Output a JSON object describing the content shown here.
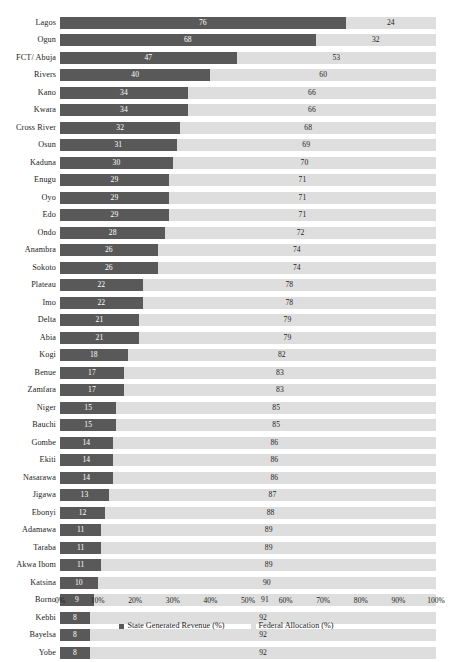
{
  "chart_data": {
    "type": "bar",
    "subtype": "stacked-horizontal-100-percent",
    "title": "",
    "subtitle": "",
    "xlabel": "",
    "ylabel": "",
    "xlim": [
      0,
      100
    ],
    "grid": false,
    "legend_position": "bottom",
    "axis_tick_labels": [
      "0%",
      "10%",
      "20%",
      "30%",
      "40%",
      "50%",
      "60%",
      "70%",
      "80%",
      "90%",
      "100%"
    ],
    "axis_tick_values": [
      0,
      10,
      20,
      30,
      40,
      50,
      60,
      70,
      80,
      90,
      100
    ],
    "categories": [
      "Lagos",
      "Ogun",
      "FCT/ Abuja",
      "Rivers",
      "Kano",
      "Kwara",
      "Cross River",
      "Osun",
      "Kaduna",
      "Enugu",
      "Oyo",
      "Edo",
      "Ondo",
      "Anambra",
      "Sokoto",
      "Plateau",
      "Imo",
      "Delta",
      "Abia",
      "Kogi",
      "Benue",
      "Zamfara",
      "Niger",
      "Bauchi",
      "Gombe",
      "Ekiti",
      "Nasarawa",
      "Jigawa",
      "Ebonyi",
      "Adamawa",
      "Taraba",
      "Akwa Ibom",
      "Katsina",
      "Borno",
      "Kebbi",
      "Bayelsa",
      "Yobe"
    ],
    "series": [
      {
        "name": "State Generated Revenue (%)",
        "color": "#595959",
        "values": [
          76,
          68,
          47,
          40,
          34,
          34,
          32,
          31,
          30,
          29,
          29,
          29,
          28,
          26,
          26,
          22,
          22,
          21,
          21,
          18,
          17,
          17,
          15,
          15,
          14,
          14,
          14,
          13,
          12,
          11,
          11,
          11,
          10,
          9,
          8,
          8,
          8
        ]
      },
      {
        "name": "Federal Allocation (%)",
        "color": "#dedede",
        "values": [
          24,
          32,
          53,
          60,
          66,
          66,
          68,
          69,
          70,
          71,
          71,
          71,
          72,
          74,
          74,
          78,
          78,
          79,
          79,
          82,
          83,
          83,
          85,
          85,
          86,
          86,
          86,
          87,
          88,
          89,
          89,
          89,
          90,
          91,
          92,
          92,
          92
        ]
      }
    ]
  },
  "legend": {
    "items": [
      {
        "label": "State Generated Revenue (%)",
        "color": "#595959"
      },
      {
        "label": "Federal Allocation (%)",
        "color": "#dedede"
      }
    ]
  }
}
